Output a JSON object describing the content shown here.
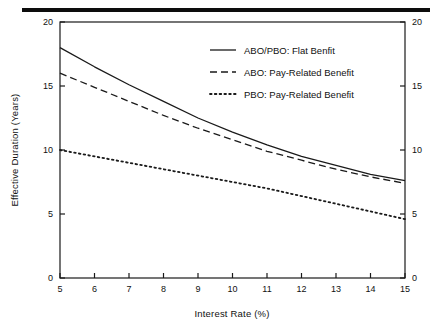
{
  "figure": {
    "has_top_rule": true,
    "background_color": "#ffffff",
    "line_color": "#1a1a1a"
  },
  "chart_data": {
    "type": "line",
    "title": "",
    "xlabel": "Interest Rate (%)",
    "ylabel": "Effective Duration (Years)",
    "xlim": [
      5,
      15
    ],
    "ylim": [
      0,
      20
    ],
    "xticks": [
      5,
      6,
      7,
      8,
      9,
      10,
      11,
      12,
      13,
      14,
      15
    ],
    "xticklabels": [
      "5",
      "6",
      "7",
      "8",
      "9",
      "10",
      "11",
      "12",
      "13",
      "14",
      "15"
    ],
    "yticks": [
      0,
      5,
      10,
      15,
      20
    ],
    "yticklabels": [
      "0",
      "5",
      "10",
      "15",
      "20"
    ],
    "right_axis_yticks": [
      0,
      5,
      10,
      15,
      20
    ],
    "right_axis_yticklabels": [
      "0",
      "5",
      "10",
      "15",
      "20"
    ],
    "grid": false,
    "legend_position": "upper right",
    "x": [
      5,
      6,
      7,
      8,
      9,
      10,
      11,
      12,
      13,
      14,
      15
    ],
    "series": [
      {
        "name": "ABO/PBO: Flat Benfit",
        "style": "solid",
        "values": [
          18.0,
          16.5,
          15.1,
          13.8,
          12.5,
          11.4,
          10.4,
          9.5,
          8.8,
          8.1,
          7.6
        ]
      },
      {
        "name": "ABO: Pay-Related Benefit",
        "style": "dashed",
        "values": [
          16.0,
          14.9,
          13.8,
          12.7,
          11.7,
          10.8,
          9.9,
          9.2,
          8.5,
          7.9,
          7.4
        ]
      },
      {
        "name": "PBO: Pay-Related Benefit",
        "style": "dotted",
        "values": [
          10.0,
          9.5,
          9.0,
          8.5,
          8.0,
          7.5,
          7.0,
          6.4,
          5.8,
          5.2,
          4.6
        ]
      }
    ]
  },
  "legend": {
    "entries": [
      {
        "label": "ABO/PBO: Flat Benfit",
        "style": "solid"
      },
      {
        "label": "ABO: Pay-Related Benefit",
        "style": "dashed"
      },
      {
        "label": "PBO: Pay-Related Benefit",
        "style": "dotted"
      }
    ]
  }
}
